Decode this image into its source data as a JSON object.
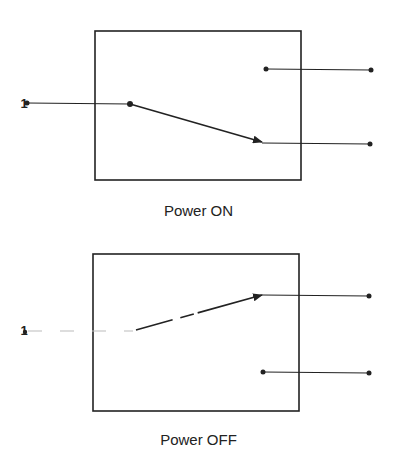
{
  "diagram": {
    "type": "switch-state",
    "panels": [
      {
        "label": "Power ON",
        "input_label": "1",
        "state": "switch connects input to bottom output"
      },
      {
        "label": "Power OFF",
        "input_label": "1",
        "state": "switch connects input to top output"
      }
    ],
    "colors": {
      "line": "#222222",
      "background": "#ffffff"
    }
  }
}
